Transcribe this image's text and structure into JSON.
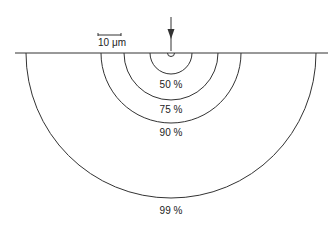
{
  "diagram": {
    "scale_bar": {
      "label": "10 μm",
      "x1": 98,
      "x2": 121,
      "y": 35
    },
    "surface_line": {
      "x1": 15,
      "x2": 328,
      "y": 53
    },
    "arrow": {
      "x": 171,
      "y1": 17,
      "y2": 51
    },
    "source_circle": {
      "r": 3.5
    },
    "center_x": 171,
    "contours": [
      {
        "label": "50 %",
        "r": 21,
        "label_y": 88
      },
      {
        "label": "75 %",
        "r": 47,
        "label_y": 113
      },
      {
        "label": "90 %",
        "r": 70,
        "label_y": 136
      },
      {
        "label": "99 %",
        "r": 145,
        "label_y": 214
      }
    ],
    "colors": {
      "line": "#333333",
      "background": "#ffffff"
    }
  }
}
